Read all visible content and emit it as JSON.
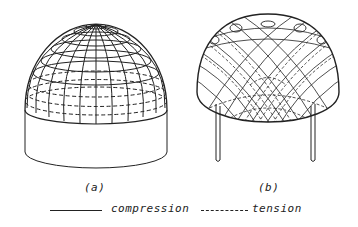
{
  "figure": {
    "panels": [
      {
        "id": "a",
        "caption": "(a)",
        "description": "hemispherical dome on cylindrical base with meridian and hoop lines; upper hoops solid, lower hoops dashed"
      },
      {
        "id": "b",
        "caption": "(b)",
        "description": "dome on four column supports showing crossing stress trajectory lines, solid and dashed"
      }
    ],
    "legend": {
      "items": [
        {
          "line_style": "solid",
          "label": "compression"
        },
        {
          "line_style": "dashed",
          "label": "tension"
        }
      ]
    },
    "colors": {
      "ink": "#222222",
      "background": "#ffffff"
    }
  }
}
